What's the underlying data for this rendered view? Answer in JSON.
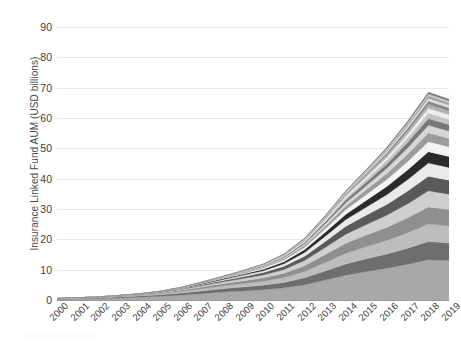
{
  "chart": {
    "ylabel": "Insurance Linked Fund AUM (USD billions)",
    "xlabel": "",
    "title": ""
  },
  "chart_data": {
    "type": "area",
    "stacked": true,
    "title": "",
    "xlabel": "",
    "ylabel": "Insurance Linked Fund AUM (USD billions)",
    "ylim": [
      0,
      90
    ],
    "yticks": [
      0,
      10,
      20,
      30,
      40,
      50,
      60,
      70,
      80,
      90
    ],
    "grid": true,
    "legend": "none",
    "categories": [
      "2000",
      "2001",
      "2002",
      "2003",
      "2004",
      "2005",
      "2006",
      "2007",
      "2008",
      "2009",
      "2010",
      "2011",
      "2012",
      "2013",
      "2014",
      "2015",
      "2016",
      "2017",
      "2018",
      "2019"
    ],
    "series": [
      {
        "name": "Fund 1",
        "color": "#a8a8a8",
        "values": [
          0.3,
          0.4,
          0.5,
          0.7,
          0.9,
          1.2,
          1.6,
          2.1,
          2.6,
          3.0,
          3.4,
          4.0,
          5.0,
          6.6,
          8.2,
          9.4,
          10.5,
          11.8,
          13.3,
          13.0
        ]
      },
      {
        "name": "Fund 2",
        "color": "#6e6e6e",
        "values": [
          0.1,
          0.15,
          0.2,
          0.3,
          0.4,
          0.5,
          0.7,
          0.9,
          1.1,
          1.3,
          1.5,
          1.8,
          2.3,
          3.0,
          3.7,
          4.2,
          4.7,
          5.3,
          6.0,
          5.8
        ]
      },
      {
        "name": "Fund 3",
        "color": "#bdbdbd",
        "values": [
          0.05,
          0.08,
          0.12,
          0.18,
          0.25,
          0.35,
          0.5,
          0.7,
          0.9,
          1.1,
          1.3,
          1.6,
          2.1,
          2.8,
          3.5,
          4.0,
          4.5,
          5.1,
          5.8,
          5.6
        ]
      },
      {
        "name": "Fund 4",
        "color": "#8f8f8f",
        "values": [
          0.03,
          0.05,
          0.08,
          0.12,
          0.18,
          0.26,
          0.38,
          0.55,
          0.72,
          0.9,
          1.1,
          1.4,
          1.9,
          2.6,
          3.3,
          3.8,
          4.3,
          4.9,
          5.6,
          5.4
        ]
      },
      {
        "name": "Fund 5",
        "color": "#cfcfcf",
        "values": [
          0.02,
          0.03,
          0.05,
          0.08,
          0.12,
          0.18,
          0.28,
          0.42,
          0.58,
          0.75,
          0.95,
          1.25,
          1.7,
          2.3,
          3.0,
          3.5,
          4.0,
          4.6,
          5.3,
          5.1
        ]
      },
      {
        "name": "Fund 6",
        "color": "#5a5a5a",
        "values": [
          0.01,
          0.02,
          0.03,
          0.05,
          0.08,
          0.13,
          0.2,
          0.32,
          0.46,
          0.6,
          0.78,
          1.05,
          1.45,
          2.0,
          2.6,
          3.1,
          3.6,
          4.2,
          4.8,
          4.6
        ]
      },
      {
        "name": "Fund 7",
        "color": "#eaeaea",
        "values": [
          0.01,
          0.01,
          0.02,
          0.03,
          0.05,
          0.09,
          0.15,
          0.24,
          0.35,
          0.48,
          0.63,
          0.86,
          1.2,
          1.7,
          2.2,
          2.7,
          3.2,
          3.8,
          4.4,
          4.2
        ]
      },
      {
        "name": "Fund 8",
        "color": "#2b2b2b",
        "values": [
          0.0,
          0.01,
          0.01,
          0.02,
          0.03,
          0.06,
          0.1,
          0.17,
          0.26,
          0.36,
          0.49,
          0.68,
          0.96,
          1.35,
          1.8,
          2.2,
          2.7,
          3.2,
          3.7,
          3.6
        ]
      },
      {
        "name": "Fund 9",
        "color": "#f4f4f4",
        "values": [
          0.0,
          0.0,
          0.01,
          0.01,
          0.02,
          0.04,
          0.07,
          0.12,
          0.19,
          0.27,
          0.38,
          0.54,
          0.78,
          1.1,
          1.5,
          1.9,
          2.3,
          2.8,
          3.3,
          3.2
        ]
      },
      {
        "name": "Fund 10",
        "color": "#9c9c9c",
        "values": [
          0.0,
          0.0,
          0.0,
          0.01,
          0.01,
          0.03,
          0.05,
          0.09,
          0.14,
          0.21,
          0.3,
          0.43,
          0.63,
          0.9,
          1.25,
          1.6,
          2.0,
          2.4,
          2.9,
          2.8
        ]
      },
      {
        "name": "Fund 11",
        "color": "#d6d6d6",
        "values": [
          0.0,
          0.0,
          0.0,
          0.0,
          0.01,
          0.02,
          0.04,
          0.07,
          0.11,
          0.16,
          0.24,
          0.35,
          0.52,
          0.75,
          1.05,
          1.35,
          1.7,
          2.1,
          2.5,
          2.4
        ]
      },
      {
        "name": "Fund 12",
        "color": "#777777",
        "values": [
          0.0,
          0.0,
          0.0,
          0.0,
          0.0,
          0.01,
          0.03,
          0.05,
          0.08,
          0.13,
          0.19,
          0.28,
          0.42,
          0.62,
          0.88,
          1.15,
          1.45,
          1.8,
          2.2,
          2.1
        ]
      },
      {
        "name": "Fund 13",
        "color": "#c4c4c4",
        "values": [
          0.0,
          0.0,
          0.0,
          0.0,
          0.0,
          0.01,
          0.02,
          0.04,
          0.06,
          0.1,
          0.15,
          0.22,
          0.34,
          0.5,
          0.72,
          0.95,
          1.2,
          1.5,
          1.85,
          1.8
        ]
      },
      {
        "name": "Fund 14",
        "color": "#ededed",
        "values": [
          0.0,
          0.0,
          0.0,
          0.0,
          0.0,
          0.0,
          0.01,
          0.03,
          0.05,
          0.08,
          0.12,
          0.18,
          0.27,
          0.4,
          0.58,
          0.78,
          1.0,
          1.25,
          1.55,
          1.5
        ]
      },
      {
        "name": "Fund 15",
        "color": "#b2b2b2",
        "values": [
          0.0,
          0.0,
          0.0,
          0.0,
          0.0,
          0.0,
          0.01,
          0.02,
          0.04,
          0.06,
          0.09,
          0.14,
          0.21,
          0.32,
          0.47,
          0.63,
          0.82,
          1.05,
          1.3,
          1.25
        ]
      },
      {
        "name": "Fund 16",
        "color": "#868686",
        "values": [
          0.0,
          0.0,
          0.0,
          0.0,
          0.0,
          0.0,
          0.01,
          0.02,
          0.03,
          0.05,
          0.07,
          0.11,
          0.17,
          0.26,
          0.38,
          0.52,
          0.68,
          0.88,
          1.1,
          1.05
        ]
      },
      {
        "name": "Fund 17",
        "color": "#dedede",
        "values": [
          0.0,
          0.0,
          0.0,
          0.0,
          0.0,
          0.0,
          0.0,
          0.01,
          0.02,
          0.04,
          0.06,
          0.09,
          0.14,
          0.21,
          0.31,
          0.43,
          0.57,
          0.74,
          0.93,
          0.9
        ]
      },
      {
        "name": "Fund 18",
        "color": "#9f9f9f",
        "values": [
          0.0,
          0.0,
          0.0,
          0.0,
          0.0,
          0.0,
          0.0,
          0.01,
          0.02,
          0.03,
          0.05,
          0.07,
          0.11,
          0.17,
          0.25,
          0.35,
          0.47,
          0.62,
          0.78,
          0.75
        ]
      },
      {
        "name": "Fund 19",
        "color": "#cacaca",
        "values": [
          0.0,
          0.0,
          0.0,
          0.0,
          0.0,
          0.0,
          0.0,
          0.0,
          0.01,
          0.02,
          0.04,
          0.06,
          0.09,
          0.14,
          0.2,
          0.29,
          0.39,
          0.52,
          0.66,
          0.63
        ]
      },
      {
        "name": "Fund 20",
        "color": "#707070",
        "values": [
          0.0,
          0.0,
          0.0,
          0.0,
          0.0,
          0.0,
          0.0,
          0.0,
          0.01,
          0.02,
          0.03,
          0.05,
          0.07,
          0.11,
          0.16,
          0.23,
          0.32,
          0.43,
          0.55,
          0.52
        ]
      }
    ],
    "totals": [
      0.52,
      0.75,
      1.02,
      1.5,
      2.05,
      2.9,
      4.15,
      6.28,
      8.7,
      11.07,
      13.83,
      18.16,
      24.31,
      33.09,
      42.8,
      51.04,
      59.34,
      69.22,
      79.92,
      77.75
    ],
    "peak_year": "2018",
    "peak_value": 88
  }
}
